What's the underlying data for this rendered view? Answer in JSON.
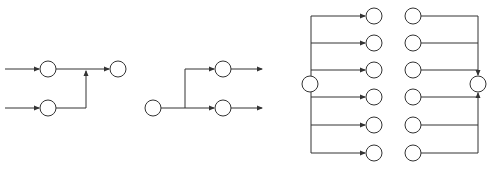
{
  "diagram": {
    "title": "",
    "colors": {
      "stroke": "#333333",
      "background": "#ffffff"
    },
    "node_radius": 8,
    "panels": [
      {
        "id": "merge-two-to-one",
        "description": "Two input nodes merge into one output node",
        "nodes": [
          {
            "id": "a1",
            "x": 48,
            "y": 69
          },
          {
            "id": "a2",
            "x": 48,
            "y": 108
          },
          {
            "id": "a3",
            "x": 118,
            "y": 69
          }
        ]
      },
      {
        "id": "split-one-to-two",
        "description": "One input node splits into two nodes with outgoing arrows",
        "nodes": [
          {
            "id": "b1",
            "x": 153,
            "y": 108
          },
          {
            "id": "b2",
            "x": 223,
            "y": 69
          },
          {
            "id": "b3",
            "x": 223,
            "y": 108
          }
        ]
      },
      {
        "id": "fan-out-one-to-six",
        "description": "One node fans out to six nodes",
        "nodes": [
          {
            "id": "c0",
            "x": 310,
            "y": 84
          },
          {
            "id": "c1",
            "x": 374,
            "y": 16
          },
          {
            "id": "c2",
            "x": 374,
            "y": 43
          },
          {
            "id": "c3",
            "x": 374,
            "y": 70
          },
          {
            "id": "c4",
            "x": 374,
            "y": 97
          },
          {
            "id": "c5",
            "x": 374,
            "y": 125
          },
          {
            "id": "c6",
            "x": 374,
            "y": 153
          }
        ]
      },
      {
        "id": "fan-in-six-to-one",
        "description": "Six nodes fan in to one node",
        "nodes": [
          {
            "id": "d1",
            "x": 413,
            "y": 16
          },
          {
            "id": "d2",
            "x": 413,
            "y": 43
          },
          {
            "id": "d3",
            "x": 413,
            "y": 70
          },
          {
            "id": "d4",
            "x": 413,
            "y": 97
          },
          {
            "id": "d5",
            "x": 413,
            "y": 125
          },
          {
            "id": "d6",
            "x": 413,
            "y": 153
          },
          {
            "id": "d0",
            "x": 478,
            "y": 84
          }
        ]
      }
    ]
  }
}
